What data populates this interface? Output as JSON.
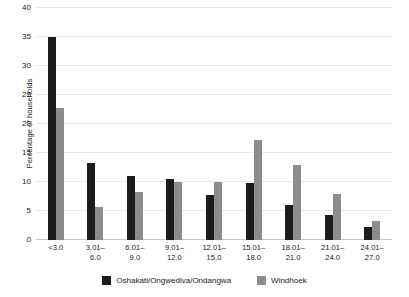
{
  "chart_data": {
    "type": "bar",
    "title": "",
    "subtitle": "",
    "xlabel": "",
    "ylabel": "Percentage of households",
    "ylim": [
      0,
      40
    ],
    "ytick_interval": 5,
    "yticks": [
      0,
      5,
      10,
      15,
      20,
      25,
      30,
      35,
      40
    ],
    "grid": true,
    "legend_position": "bottom",
    "categories": [
      "<3.0",
      "3.01–\n6.0",
      "6.01–\n9.0",
      "9.01–\n12.0",
      "12.01–\n15.0",
      "15.01–\n18.0",
      "18.01–\n21.0",
      "21.01–\n24.0",
      "24.01–\n27.0"
    ],
    "series": [
      {
        "name": "Oshakati/Ongwediva/Ondangwa",
        "color": "#1c1c1c",
        "values": [
          35.0,
          13.2,
          11.0,
          10.5,
          7.8,
          9.9,
          6.0,
          4.3,
          2.3
        ]
      },
      {
        "name": "Windhoek",
        "color": "#8c8c8c",
        "values": [
          22.7,
          5.7,
          8.2,
          10.0,
          10.0,
          17.2,
          13.0,
          8.0,
          3.2
        ]
      }
    ]
  }
}
